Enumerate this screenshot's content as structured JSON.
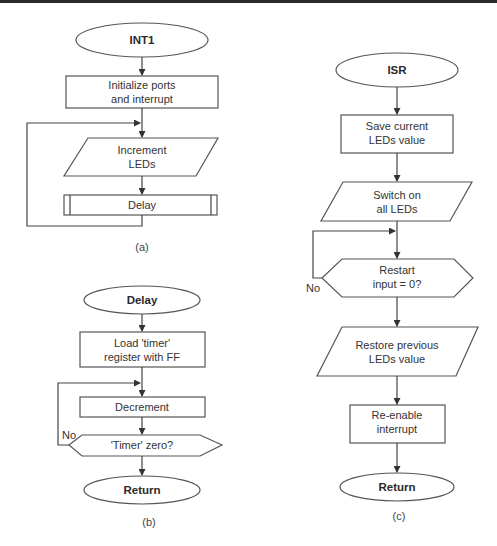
{
  "diagrams": {
    "a": {
      "caption": "(a)",
      "start": "INT1",
      "init_line1": "Initialize ports",
      "init_line2": "and interrupt",
      "increment_line1": "Increment",
      "increment_line2": "LEDs",
      "delay": "Delay"
    },
    "b": {
      "caption": "(b)",
      "start": "Delay",
      "load_line1": "Load 'timer'",
      "load_line2": "register with FF",
      "decrement": "Decrement",
      "decision": "'Timer' zero?",
      "no_label": "No",
      "end": "Return"
    },
    "c": {
      "caption": "(c)",
      "start": "ISR",
      "save_line1": "Save current",
      "save_line2": "LEDs value",
      "switch_line1": "Switch on",
      "switch_line2": "all LEDs",
      "decision_line1": "Restart",
      "decision_line2": "input = 0?",
      "no_label": "No",
      "restore_line1": "Restore previous",
      "restore_line2": "LEDs value",
      "reenable_line1": "Re-enable",
      "reenable_line2": "interrupt",
      "end": "Return"
    }
  }
}
